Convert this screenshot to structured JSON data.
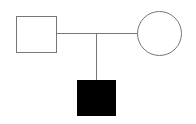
{
  "diagram": {
    "type": "pedigree",
    "nodes": [
      {
        "id": "father",
        "shape": "square",
        "sex": "male",
        "affected": false,
        "fill": "#ffffff",
        "stroke": "#777777"
      },
      {
        "id": "mother",
        "shape": "circle",
        "sex": "female",
        "affected": false,
        "fill": "#ffffff",
        "stroke": "#777777"
      },
      {
        "id": "child",
        "shape": "square",
        "sex": "male",
        "affected": true,
        "fill": "#000000",
        "stroke": "#000000"
      }
    ],
    "edges": [
      {
        "type": "mating",
        "from": "father",
        "to": "mother"
      },
      {
        "type": "descent",
        "from": "mating-line",
        "to": "child"
      }
    ],
    "colors": {
      "line": "#777777",
      "affected": "#000000",
      "unaffected": "#ffffff"
    }
  }
}
